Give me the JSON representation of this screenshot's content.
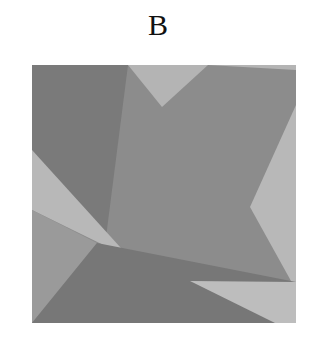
{
  "label": "B",
  "square": {
    "x": 32,
    "y": 65,
    "width": 264,
    "height": 258
  },
  "polygons": [
    {
      "name": "base-mid-gray",
      "fill": "#8c8c8c",
      "points": "32,65 296,65 296,323 32,323"
    },
    {
      "name": "top-left-dark",
      "fill": "#7a7a7a",
      "points": "32,65 128,65 105,245 32,150"
    },
    {
      "name": "top-center-light",
      "fill": "#b4b4b4",
      "points": "128,65 208,65 162,107"
    },
    {
      "name": "top-right-light",
      "fill": "#b4b4b4",
      "points": "208,65 296,65 296,70"
    },
    {
      "name": "right-light-wedge",
      "fill": "#b8b8b8",
      "points": "296,105 250,207 296,290"
    },
    {
      "name": "left-light-band",
      "fill": "#b8b8b8",
      "points": "32,150 32,210 130,258"
    },
    {
      "name": "left-lower-gray",
      "fill": "#9a9a9a",
      "points": "32,210 32,323 97,243"
    },
    {
      "name": "bottom-dark",
      "fill": "#777777",
      "points": "32,323 97,243 296,282 296,323"
    },
    {
      "name": "bottom-right-light",
      "fill": "#bdbdbd",
      "points": "190,281 296,282 296,323 275,323"
    }
  ]
}
